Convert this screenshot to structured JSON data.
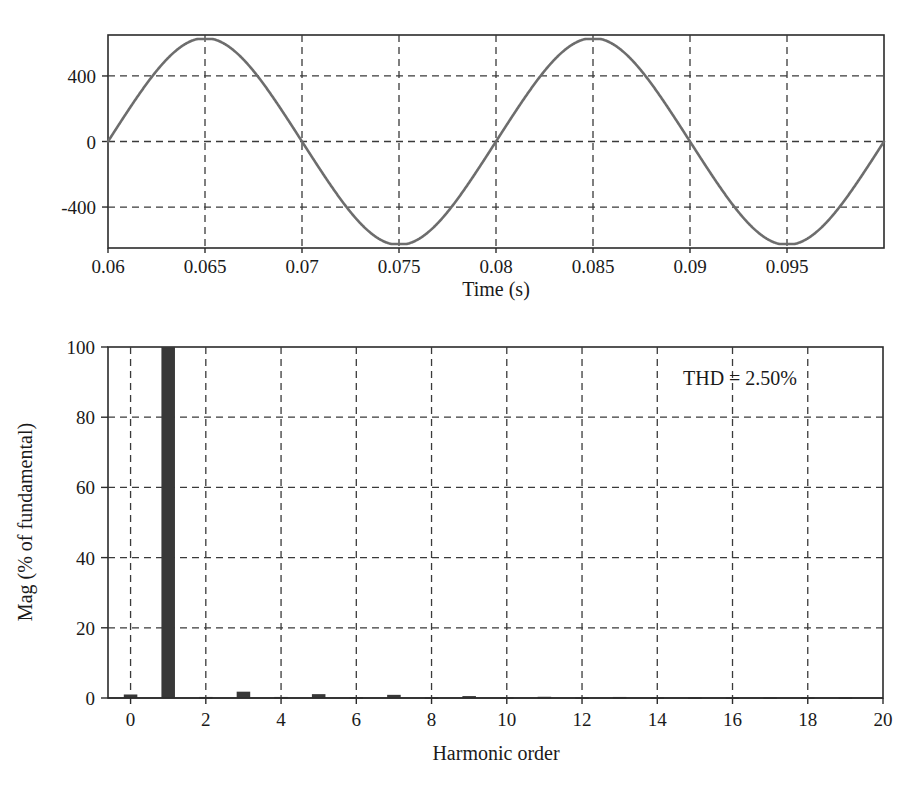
{
  "figure": {
    "background_color": "#ffffff",
    "text_color": "#1a1a1a"
  },
  "chart_data": [
    {
      "id": "waveform",
      "type": "line",
      "title": "",
      "xlabel": "Time (s)",
      "ylabel": "",
      "xlim": [
        0.06,
        0.1
      ],
      "ylim": [
        -650,
        650
      ],
      "xticks": [
        0.06,
        0.065,
        0.07,
        0.075,
        0.08,
        0.085,
        0.09,
        0.095
      ],
      "xticklabels": [
        "0.06",
        "0.065",
        "0.07",
        "0.075",
        "0.08",
        "0.085",
        "0.09",
        "0.095"
      ],
      "yticks": [
        -400,
        0,
        400
      ],
      "yticklabels": [
        "-400",
        "0",
        "400"
      ],
      "grid": true,
      "grid_style": "dashed",
      "series": [
        {
          "name": "voltage",
          "color": "#6d6d6d",
          "description": "Distorted sinusoid, 50 Hz fundamental with small third-harmonic content causing slightly flattened peaks",
          "fundamental_frequency_hz": 50,
          "amplitude": 620,
          "third_harmonic_ratio": 0.018,
          "phase_rad": 0
        }
      ]
    },
    {
      "id": "spectrum",
      "type": "bar",
      "title": "",
      "xlabel": "Harmonic order",
      "ylabel": "Mag (% of fundamental)",
      "xlim": [
        -0.6,
        20
      ],
      "ylim": [
        0,
        100
      ],
      "xticks": [
        0,
        2,
        4,
        6,
        8,
        10,
        12,
        14,
        16,
        18,
        20
      ],
      "xticklabels": [
        "0",
        "2",
        "4",
        "6",
        "8",
        "10",
        "12",
        "14",
        "16",
        "18",
        "20"
      ],
      "yticks": [
        0,
        20,
        40,
        60,
        80,
        100
      ],
      "yticklabels": [
        "0",
        "20",
        "40",
        "60",
        "80",
        "100"
      ],
      "grid": true,
      "grid_style": "dashed",
      "bar_color": "#383838",
      "categories": [
        0,
        1,
        2,
        3,
        4,
        5,
        6,
        7,
        8,
        9,
        10,
        11,
        12,
        13,
        14,
        15,
        16,
        17,
        18,
        19
      ],
      "values": [
        1.0,
        100.0,
        0.3,
        1.8,
        0.3,
        1.1,
        0.25,
        0.9,
        0.2,
        0.55,
        0.2,
        0.35,
        0.2,
        0.3,
        0.15,
        0.15,
        0.15,
        0.12,
        0.12,
        0.15
      ],
      "annotations": [
        {
          "name": "thd-annotation",
          "text": "THD = 2.50%",
          "x_value": 16.2,
          "y_value": 91
        }
      ]
    }
  ]
}
